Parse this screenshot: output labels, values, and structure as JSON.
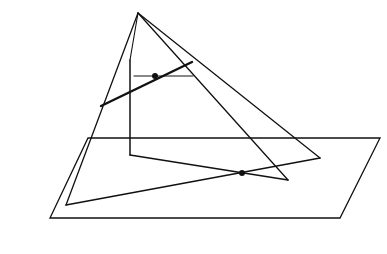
{
  "diagram": {
    "title": "",
    "colors": {
      "background": "#ffffff",
      "stroke": "#111111"
    },
    "plane": {
      "points": [
        [
          88,
          138
        ],
        [
          380,
          138
        ],
        [
          340,
          218
        ],
        [
          50,
          218
        ]
      ]
    },
    "apex": [
      138,
      13
    ],
    "edges": [
      {
        "id": "left-edge",
        "from": [
          138,
          13
        ],
        "to": [
          66,
          205
        ],
        "width": 1.3
      },
      {
        "id": "right-edge",
        "from": [
          138,
          13
        ],
        "to": [
          320,
          158
        ],
        "width": 1.3
      },
      {
        "id": "inner-edge",
        "from": [
          138,
          13
        ],
        "to": [
          130,
          60
        ],
        "width": 1.1
      },
      {
        "id": "inner-vertical",
        "from": [
          130,
          60
        ],
        "to": [
          130,
          155
        ],
        "width": 1.5
      },
      {
        "id": "inner-base",
        "from": [
          130,
          155
        ],
        "to": [
          288,
          180
        ],
        "width": 1.5
      },
      {
        "id": "front-edge",
        "from": [
          138,
          13
        ],
        "to": [
          288,
          180
        ],
        "width": 1.3
      },
      {
        "id": "base-line",
        "from": [
          66,
          205
        ],
        "to": [
          320,
          158
        ],
        "width": 1.6
      },
      {
        "id": "horizontal-segment",
        "from": [
          134,
          76
        ],
        "to": [
          193,
          76
        ],
        "width": 1
      },
      {
        "id": "transversal-line",
        "from": [
          101,
          106
        ],
        "to": [
          192,
          62
        ],
        "width": 2.4
      }
    ],
    "points": [
      {
        "id": "upper-point",
        "at": [
          155,
          76
        ],
        "r": 3
      },
      {
        "id": "lower-point",
        "at": [
          242,
          173
        ],
        "r": 3
      }
    ]
  }
}
